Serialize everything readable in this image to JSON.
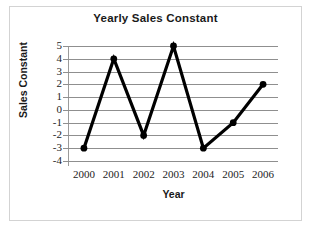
{
  "chart_data": {
    "type": "line",
    "title": "Yearly Sales Constant",
    "xlabel": "Year",
    "ylabel": "Sales Constant",
    "categories": [
      "2000",
      "2001",
      "2002",
      "2003",
      "2004",
      "2005",
      "2006"
    ],
    "values": [
      -3,
      4,
      -2,
      5,
      -3,
      -1,
      2
    ],
    "series": [
      {
        "name": "Sales Constant",
        "values": [
          -3,
          4,
          -2,
          5,
          -3,
          -1,
          2
        ]
      }
    ],
    "ylim": [
      -4,
      5
    ],
    "yticks": [
      5,
      4,
      3,
      2,
      1,
      0,
      -1,
      -2,
      -3,
      -4
    ],
    "ytick_labels": [
      "5",
      "4",
      "3",
      "2",
      "1",
      "0",
      "-1",
      "-2",
      "-3",
      "-4"
    ],
    "grid": "horizontal",
    "legend": "none",
    "marker": "filled-circle",
    "line_color": "#000000",
    "grid_color": "#8f8f8f",
    "border_color": "#d3d3d3",
    "text_color": "#1a1a1a"
  }
}
